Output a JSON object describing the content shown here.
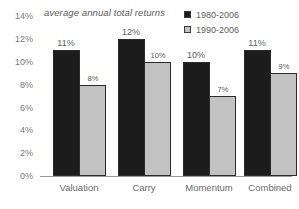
{
  "chart_data": {
    "type": "bar",
    "title": "average annual total returns",
    "xlabel": "",
    "ylabel": "",
    "ylim": [
      0,
      14
    ],
    "grid": false,
    "legend_position": "top-right",
    "y_ticks": [
      "14%",
      "12%",
      "10%",
      "8%",
      "6%",
      "4%",
      "2%",
      "0%"
    ],
    "y_tick_values": [
      14,
      12,
      10,
      8,
      6,
      4,
      2,
      0
    ],
    "categories": [
      "Valuation",
      "Carry",
      "Momentum",
      "Combined"
    ],
    "series": [
      {
        "name": "1980-2006",
        "color": "#1c1c1c",
        "values": [
          11,
          12,
          10,
          11
        ],
        "labels": [
          "11%",
          "12%",
          "10%",
          "11%"
        ]
      },
      {
        "name": "1990-2006",
        "color": "#c2c2c2",
        "values": [
          8,
          10,
          7,
          9
        ],
        "labels": [
          "8%",
          "10%",
          "7%",
          "9%"
        ]
      }
    ]
  }
}
